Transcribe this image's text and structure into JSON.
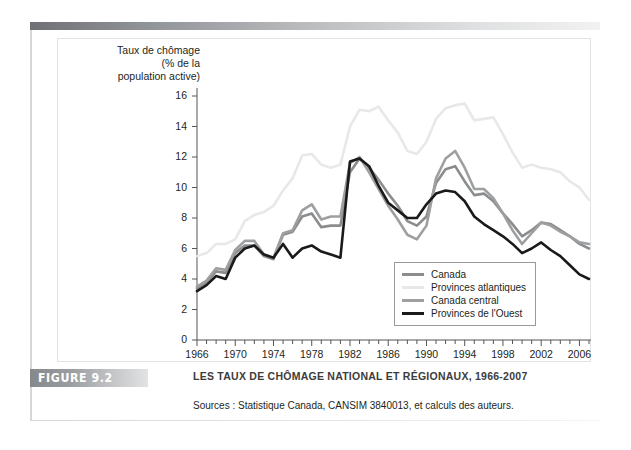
{
  "figure": {
    "badge": "FIGURE 9.2",
    "caption_title": "LES TAUX DE CHÔMAGE NATIONAL ET RÉGIONAUX, 1966-2007",
    "source": "Sources : Statistique Canada, CANSIM 3840013, et calculs des auteurs."
  },
  "chart_data": {
    "type": "line",
    "title": "LES TAUX DE CHÔMAGE NATIONAL ET RÉGIONAUX, 1966-2007",
    "ylabel": "Taux de chômage (% de la population active)",
    "ylabel_lines": [
      "Taux de chômage",
      "(% de la",
      "population active)"
    ],
    "xlabel": "",
    "xlim": [
      1966,
      2007
    ],
    "ylim": [
      0,
      16
    ],
    "yticks": [
      0,
      2,
      4,
      6,
      8,
      10,
      12,
      14,
      16
    ],
    "xticks": [
      1966,
      1970,
      1974,
      1978,
      1982,
      1986,
      1990,
      1994,
      1998,
      2002,
      2006
    ],
    "xtick_minor_step": 1,
    "grid": false,
    "legend_position": "inside-bottom-right",
    "x": [
      1966,
      1967,
      1968,
      1969,
      1970,
      1971,
      1972,
      1973,
      1974,
      1975,
      1976,
      1977,
      1978,
      1979,
      1980,
      1981,
      1982,
      1983,
      1984,
      1985,
      1986,
      1987,
      1988,
      1989,
      1990,
      1991,
      1992,
      1993,
      1994,
      1995,
      1996,
      1997,
      1998,
      1999,
      2000,
      2001,
      2002,
      2003,
      2004,
      2005,
      2006,
      2007
    ],
    "series": [
      {
        "name": "Canada",
        "color": "#8a8c8e",
        "width": 2.6,
        "values": [
          3.4,
          3.8,
          4.5,
          4.4,
          5.7,
          6.2,
          6.2,
          5.5,
          5.3,
          6.9,
          7.1,
          8.1,
          8.3,
          7.4,
          7.5,
          7.5,
          11.0,
          11.9,
          11.3,
          10.5,
          9.6,
          8.8,
          7.8,
          7.5,
          8.1,
          10.3,
          11.2,
          11.4,
          10.4,
          9.5,
          9.6,
          9.1,
          8.3,
          7.6,
          6.8,
          7.2,
          7.7,
          7.6,
          7.2,
          6.8,
          6.3,
          6.0
        ]
      },
      {
        "name": "Provinces atlantiques",
        "color": "#e8e8e8",
        "width": 2.6,
        "values": [
          5.5,
          5.7,
          6.3,
          6.3,
          6.6,
          7.8,
          8.2,
          8.4,
          8.8,
          9.8,
          10.6,
          12.1,
          12.2,
          11.5,
          11.3,
          11.5,
          14.0,
          15.1,
          15.0,
          15.3,
          14.4,
          13.6,
          12.4,
          12.2,
          13.0,
          14.5,
          15.2,
          15.4,
          15.5,
          14.4,
          14.5,
          14.6,
          13.5,
          12.3,
          11.3,
          11.5,
          11.3,
          11.2,
          11.0,
          10.4,
          10.0,
          9.2
        ]
      },
      {
        "name": "Canada central",
        "color": "#9d9fa1",
        "width": 2.6,
        "values": [
          3.5,
          3.9,
          4.7,
          4.6,
          5.9,
          6.5,
          6.5,
          5.6,
          5.4,
          7.0,
          7.2,
          8.5,
          8.9,
          7.9,
          8.1,
          8.1,
          11.6,
          12.0,
          11.0,
          9.9,
          8.8,
          7.9,
          6.9,
          6.6,
          7.5,
          10.6,
          11.9,
          12.4,
          11.3,
          9.9,
          9.9,
          9.3,
          8.3,
          7.2,
          6.3,
          7.0,
          7.7,
          7.5,
          7.1,
          6.8,
          6.4,
          6.3
        ]
      },
      {
        "name": "Provinces de l'Ouest",
        "color": "#1a1a1a",
        "width": 2.6,
        "values": [
          3.2,
          3.6,
          4.2,
          4.0,
          5.4,
          6.0,
          6.2,
          5.6,
          5.4,
          6.3,
          5.4,
          6.0,
          6.2,
          5.8,
          5.6,
          5.4,
          11.7,
          11.9,
          11.4,
          10.1,
          9.0,
          8.5,
          8.0,
          8.0,
          8.9,
          9.6,
          9.8,
          9.7,
          9.1,
          8.1,
          7.6,
          7.2,
          6.8,
          6.3,
          5.7,
          6.0,
          6.4,
          5.9,
          5.5,
          4.9,
          4.3,
          4.0
        ]
      }
    ]
  },
  "legend": {
    "items": [
      {
        "label": "Canada",
        "color": "#8a8c8e"
      },
      {
        "label": "Provinces atlantiques",
        "color": "#e8e8e8"
      },
      {
        "label": "Canada central",
        "color": "#9d9fa1"
      },
      {
        "label": "Provinces de l'Ouest",
        "color": "#1a1a1a"
      }
    ]
  }
}
